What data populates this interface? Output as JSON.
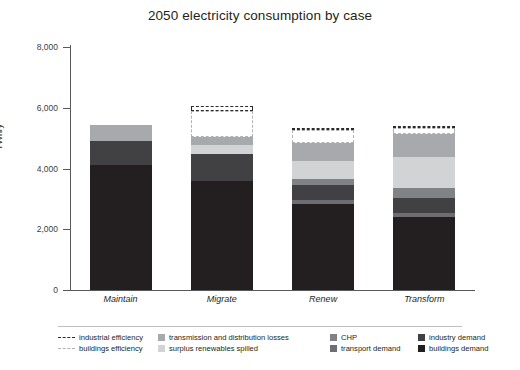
{
  "chart_data": {
    "type": "bar",
    "subtype": "stacked-bar-with-outline-overlay",
    "title": "2050 electricity consumption by case",
    "xlabel": "",
    "ylabel": "TWh/y",
    "ylim": [
      0,
      8000
    ],
    "yticks": [
      0,
      2000,
      4000,
      6000,
      8000
    ],
    "ytick_labels": [
      "0",
      "2,000",
      "4,000",
      "6,000",
      "8,000"
    ],
    "grid": false,
    "legend_position": "bottom",
    "categories": [
      "Maintain",
      "Migrate",
      "Renew",
      "Transform"
    ],
    "stack_order_bottom_to_top": [
      "buildings demand",
      "transport demand",
      "industry demand",
      "CHP",
      "surplus renewables spilled",
      "transmission and distribution losses"
    ],
    "series": [
      {
        "name": "buildings demand",
        "color": "#231f20",
        "values": [
          4130,
          3580,
          2820,
          2400
        ]
      },
      {
        "name": "transport demand",
        "color": "#6d6e71",
        "values": [
          0,
          0,
          130,
          140
        ]
      },
      {
        "name": "industry demand",
        "color": "#414042",
        "values": [
          790,
          900,
          520,
          480
        ]
      },
      {
        "name": "CHP",
        "color": "#808285",
        "values": [
          0,
          0,
          190,
          330
        ]
      },
      {
        "name": "surplus renewables spilled",
        "color": "#d1d3d4",
        "values": [
          0,
          300,
          600,
          1030
        ]
      },
      {
        "name": "transmission and distribution losses",
        "color": "#a7a9ac",
        "values": [
          510,
          270,
          590,
          770
        ]
      }
    ],
    "outline_series": [
      {
        "name": "buildings efficiency",
        "style": "dashed",
        "color": "#b3b3b3",
        "values": [
          0,
          840,
          420,
          180
        ]
      },
      {
        "name": "industrial efficiency",
        "style": "dashed-dark",
        "color": "#2b2b2b",
        "values": [
          0,
          160,
          80,
          70
        ]
      }
    ],
    "stack_totals_solid": [
      5430,
      5050,
      5850,
      6150
    ],
    "stack_totals_with_outline": [
      5430,
      6050,
      6350,
      6400
    ]
  },
  "legend": {
    "items": [
      {
        "label": "industrial efficiency",
        "marker": "dashed-dark-line",
        "color": "#2b2b2b"
      },
      {
        "label": "buildings efficiency",
        "marker": "dashed-light-line",
        "color": "#b3b3b3"
      },
      {
        "label": "transmission and distribution losses",
        "marker": "swatch",
        "color": "#a7a9ac"
      },
      {
        "label": "surplus renewables spilled",
        "marker": "swatch",
        "color": "#d1d3d4"
      },
      {
        "label": "CHP",
        "marker": "swatch",
        "color": "#808285"
      },
      {
        "label": "transport demand",
        "marker": "swatch",
        "color": "#6d6e71"
      },
      {
        "label": "industry demand",
        "marker": "swatch",
        "color": "#414042"
      },
      {
        "label": "buildings demand",
        "marker": "swatch",
        "color": "#231f20"
      }
    ]
  }
}
